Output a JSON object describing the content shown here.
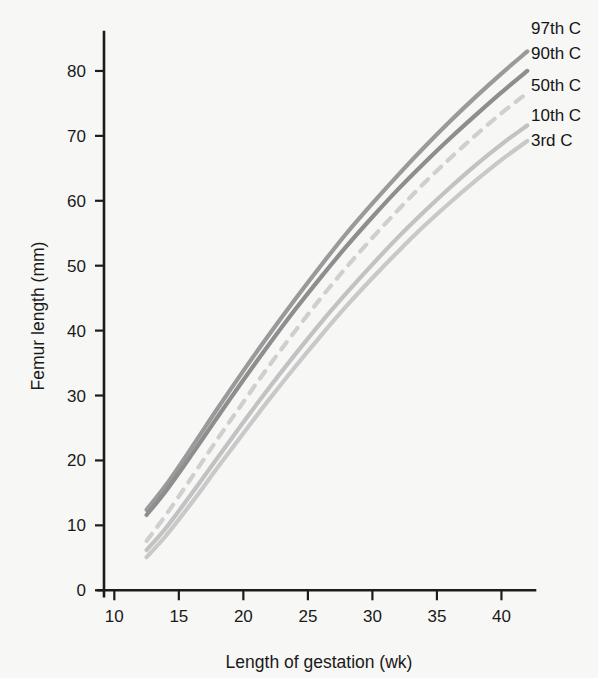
{
  "chart_data": {
    "type": "line",
    "title": "",
    "xlabel": "Length of gestation (wk)",
    "ylabel": "Femur length (mm)",
    "xlim": [
      9.2,
      42.6
    ],
    "ylim": [
      -1.5,
      86
    ],
    "xticks": [
      10,
      15,
      20,
      25,
      30,
      35,
      40
    ],
    "yticks": [
      0,
      10,
      20,
      30,
      40,
      50,
      60,
      70,
      80
    ],
    "xtick_labels": [
      "10",
      "15",
      "20",
      "25",
      "30",
      "35",
      "40"
    ],
    "ytick_labels": [
      "0",
      "10",
      "20",
      "30",
      "40",
      "50",
      "60",
      "70",
      "80"
    ],
    "grid": false,
    "legend_position": "right-outside-top",
    "x": [
      12.5,
      14,
      16,
      18,
      20,
      22,
      24,
      26,
      28,
      30,
      32,
      34,
      36,
      38,
      40,
      42
    ],
    "series": [
      {
        "name": "97th C",
        "label": "97th C",
        "color": "#9a9a9a",
        "style": "solid",
        "width": 4.2,
        "values": [
          12.4,
          16.2,
          22.0,
          28.0,
          33.8,
          39.4,
          44.8,
          50.0,
          55.0,
          59.6,
          64.0,
          68.2,
          72.2,
          76.0,
          79.6,
          83.0
        ]
      },
      {
        "name": "90th C",
        "label": "90th C",
        "color": "#8e8e8e",
        "style": "solid",
        "width": 4.2,
        "values": [
          11.6,
          15.3,
          20.9,
          26.7,
          32.4,
          37.9,
          43.2,
          48.2,
          53.0,
          57.5,
          61.8,
          65.8,
          69.6,
          73.2,
          76.7,
          80.0
        ]
      },
      {
        "name": "50th C",
        "label": "50th C",
        "color": "#cfcfcf",
        "style": "dashed",
        "width": 4.2,
        "values": [
          7.6,
          11.6,
          17.4,
          23.3,
          29.0,
          34.6,
          39.9,
          45.0,
          49.8,
          54.3,
          58.6,
          62.7,
          66.5,
          70.1,
          73.5,
          76.6
        ]
      },
      {
        "name": "10th C",
        "label": "10th C",
        "color": "#c2c2c2",
        "style": "solid",
        "width": 4.2,
        "values": [
          6.2,
          9.6,
          14.9,
          20.4,
          25.9,
          31.2,
          36.3,
          41.2,
          45.8,
          50.2,
          54.4,
          58.3,
          62.0,
          65.5,
          68.7,
          71.6
        ]
      },
      {
        "name": "3rd C",
        "label": "3rd C",
        "color": "#c9c9c9",
        "style": "solid",
        "width": 4.2,
        "values": [
          5.1,
          8.4,
          13.5,
          18.9,
          24.2,
          29.4,
          34.4,
          39.2,
          43.8,
          48.1,
          52.2,
          56.1,
          59.7,
          63.1,
          66.3,
          69.2
        ]
      }
    ]
  },
  "legend": {
    "items": [
      {
        "label": "97th C"
      },
      {
        "label": "90th C"
      },
      {
        "label": "50th C"
      },
      {
        "label": "10th C"
      },
      {
        "label": "3rd C"
      }
    ]
  },
  "axes": {
    "x_title": "Length of gestation (wk)",
    "y_title": "Femur length (mm)"
  }
}
